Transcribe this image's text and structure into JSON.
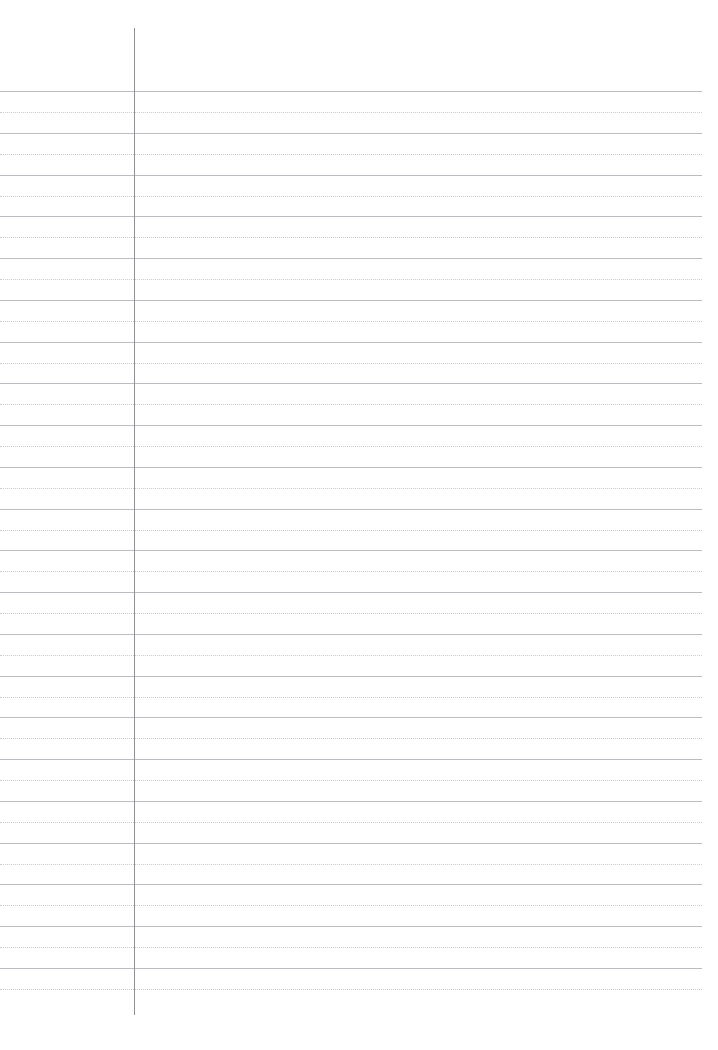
{
  "document": {
    "type": "ruled-paper-template",
    "title": "Ruled Notebook Paper",
    "page_width": 718,
    "page_height": 1050,
    "background_color": "#ffffff",
    "orientation": "portrait"
  },
  "colors": {
    "page_background": "#ffffff",
    "solid_rule": "#b9bcc0",
    "dotted_rule": "#c9ccd1",
    "margin_line": "#8e9196"
  },
  "margin_line": {
    "name": "vertical-margin-rule",
    "x": 134,
    "y_start": 28,
    "y_end": 1015,
    "thickness": 1,
    "style": "solid",
    "color": "#8e9196"
  },
  "ruling": {
    "x_start": 0,
    "x_end": 702,
    "first_line_y": 91,
    "spacing": 20.9,
    "line_count": 44,
    "pattern": [
      "solid",
      "dotted"
    ],
    "solid_thickness": 1,
    "dotted_thickness": 1,
    "dot_spacing": 3
  },
  "lines": [
    {
      "index": 1,
      "y": 91,
      "style": "solid"
    },
    {
      "index": 2,
      "y": 112,
      "style": "dotted"
    },
    {
      "index": 3,
      "y": 133,
      "style": "solid"
    },
    {
      "index": 4,
      "y": 154,
      "style": "dotted"
    },
    {
      "index": 5,
      "y": 175,
      "style": "solid"
    },
    {
      "index": 6,
      "y": 196,
      "style": "dotted"
    },
    {
      "index": 7,
      "y": 216,
      "style": "solid"
    },
    {
      "index": 8,
      "y": 237,
      "style": "dotted"
    },
    {
      "index": 9,
      "y": 258,
      "style": "solid"
    },
    {
      "index": 10,
      "y": 279,
      "style": "dotted"
    },
    {
      "index": 11,
      "y": 300,
      "style": "solid"
    },
    {
      "index": 12,
      "y": 321,
      "style": "dotted"
    },
    {
      "index": 13,
      "y": 342,
      "style": "solid"
    },
    {
      "index": 14,
      "y": 363,
      "style": "dotted"
    },
    {
      "index": 15,
      "y": 383,
      "style": "solid"
    },
    {
      "index": 16,
      "y": 404,
      "style": "dotted"
    },
    {
      "index": 17,
      "y": 425,
      "style": "solid"
    },
    {
      "index": 18,
      "y": 446,
      "style": "dotted"
    },
    {
      "index": 19,
      "y": 467,
      "style": "solid"
    },
    {
      "index": 20,
      "y": 488,
      "style": "dotted"
    },
    {
      "index": 21,
      "y": 509,
      "style": "solid"
    },
    {
      "index": 22,
      "y": 530,
      "style": "dotted"
    },
    {
      "index": 23,
      "y": 550,
      "style": "solid"
    },
    {
      "index": 24,
      "y": 571,
      "style": "dotted"
    },
    {
      "index": 25,
      "y": 592,
      "style": "solid"
    },
    {
      "index": 26,
      "y": 613,
      "style": "dotted"
    },
    {
      "index": 27,
      "y": 634,
      "style": "solid"
    },
    {
      "index": 28,
      "y": 655,
      "style": "dotted"
    },
    {
      "index": 29,
      "y": 676,
      "style": "solid"
    },
    {
      "index": 30,
      "y": 697,
      "style": "dotted"
    },
    {
      "index": 31,
      "y": 717,
      "style": "solid"
    },
    {
      "index": 32,
      "y": 738,
      "style": "dotted"
    },
    {
      "index": 33,
      "y": 759,
      "style": "solid"
    },
    {
      "index": 34,
      "y": 780,
      "style": "dotted"
    },
    {
      "index": 35,
      "y": 801,
      "style": "solid"
    },
    {
      "index": 36,
      "y": 822,
      "style": "dotted"
    },
    {
      "index": 37,
      "y": 843,
      "style": "solid"
    },
    {
      "index": 38,
      "y": 864,
      "style": "dotted"
    },
    {
      "index": 39,
      "y": 884,
      "style": "solid"
    },
    {
      "index": 40,
      "y": 905,
      "style": "dotted"
    },
    {
      "index": 41,
      "y": 926,
      "style": "solid"
    },
    {
      "index": 42,
      "y": 947,
      "style": "dotted"
    },
    {
      "index": 43,
      "y": 968,
      "style": "solid"
    },
    {
      "index": 44,
      "y": 989,
      "style": "dotted"
    }
  ],
  "regions": {
    "header_area": {
      "name": "header-blank-area",
      "y_start": 0,
      "y_end": 91
    },
    "left_margin": {
      "name": "left-margin-column",
      "x_start": 0,
      "x_end": 134
    },
    "writing_area": {
      "name": "writing-area",
      "x_start": 134,
      "x_end": 702
    },
    "footer_area": {
      "name": "footer-blank-area",
      "y_start": 989,
      "y_end": 1050
    }
  }
}
